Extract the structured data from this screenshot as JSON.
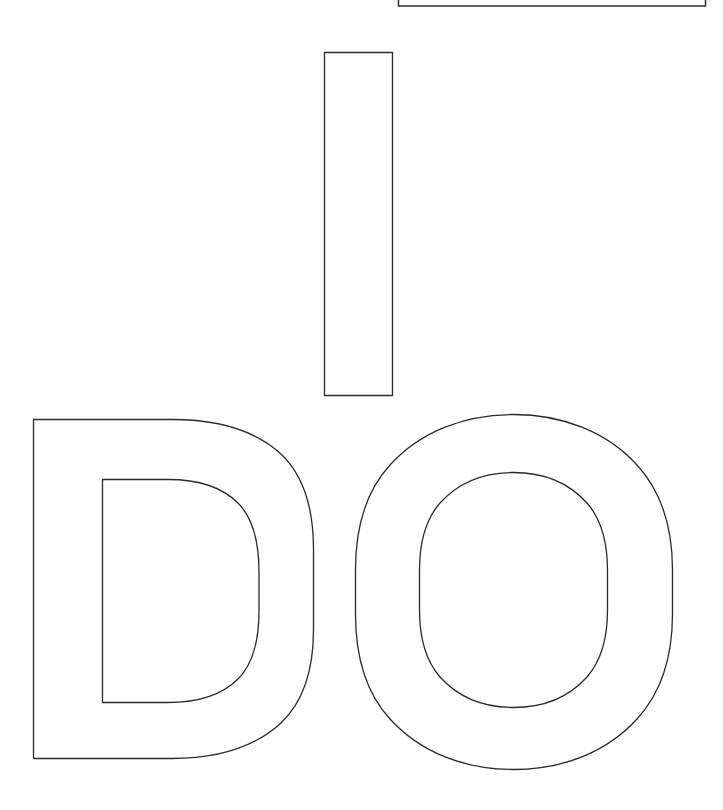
{
  "page": {
    "title": "I DO",
    "document_type": "Letter stencil outline page",
    "background_color": "#ffffff",
    "outline_color": "#2b2b2b",
    "fill_color": "#ffffff",
    "width": 723,
    "height": 810
  },
  "clipped_frame": {
    "name": "partial-rectangle-top-right",
    "description": "Thin rectangle outline cropped by the top edge of the page",
    "stroke_color": "#3a3a3a",
    "x": 398,
    "y": -10,
    "width": 307,
    "height": 16
  },
  "letters": [
    {
      "id": "letter-i",
      "character": "I",
      "shape": "rectangle",
      "x": 324,
      "y": 52,
      "width": 68,
      "height": 343
    },
    {
      "id": "letter-d",
      "character": "D",
      "shape": "d-outline-with-counter",
      "x": 33,
      "y": 419,
      "width": 280,
      "height": 340
    },
    {
      "id": "letter-o",
      "character": "O",
      "shape": "o-ring-outline",
      "x": 355,
      "y": 414,
      "width": 317,
      "height": 356
    }
  ],
  "word_lines": [
    {
      "text": "I"
    },
    {
      "text": "DO"
    }
  ]
}
